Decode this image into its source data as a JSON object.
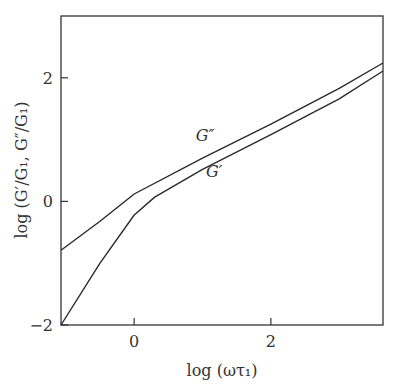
{
  "chart_data": {
    "type": "line",
    "title": "",
    "xlabel": "log (ωτ₁)",
    "ylabel": "log (G′/G₁, G″/G₁)",
    "xlim": [
      -1.07,
      3.64
    ],
    "ylim": [
      -2.0,
      3.0
    ],
    "x_ticks": [
      0,
      2
    ],
    "x_tick_labels": [
      "0",
      "2"
    ],
    "y_ticks": [
      -2,
      0,
      2
    ],
    "y_tick_labels": [
      "−2",
      "0",
      "2"
    ],
    "grid": false,
    "legend": "none (inline curve labels)",
    "note": "Values are visual estimates read off the plot using the tick marks; points between ticks are interpolated and approximate.",
    "series": [
      {
        "name": "G″",
        "label": "G″",
        "x": [
          -1.07,
          -0.5,
          0.0,
          1.0,
          2.0,
          3.0,
          3.64
        ],
        "y": [
          -0.79,
          -0.32,
          0.12,
          0.7,
          1.25,
          1.83,
          2.24
        ]
      },
      {
        "name": "G′",
        "label": "G′",
        "x": [
          -1.07,
          -0.5,
          0.0,
          0.3,
          1.0,
          2.0,
          3.0,
          3.64
        ],
        "y": [
          -2.0,
          -1.0,
          -0.22,
          0.07,
          0.52,
          1.08,
          1.66,
          2.11
        ]
      }
    ],
    "annotations": [
      {
        "text": "G″",
        "x": 0.9,
        "y": 0.97
      },
      {
        "text": "G′",
        "x": 1.05,
        "y": 0.39
      }
    ]
  }
}
